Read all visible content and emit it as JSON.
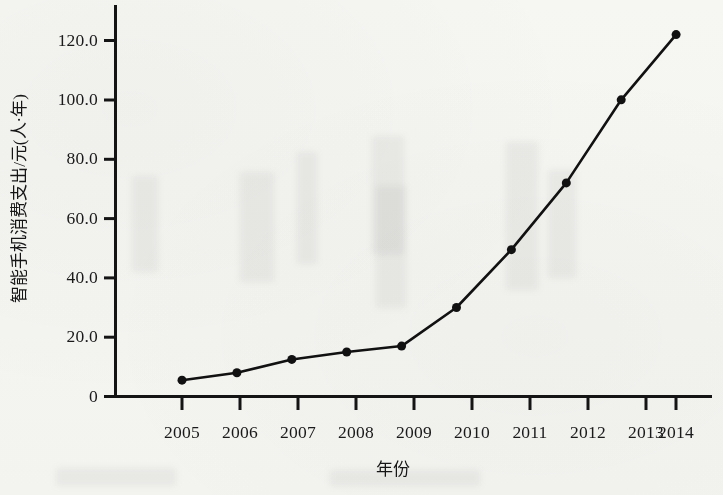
{
  "chart_data": {
    "type": "line",
    "title": "",
    "subtitle": "",
    "xlabel": "年份",
    "ylabel": "智能手机消费支出/元(人·年)",
    "x": [
      2005,
      2006,
      2007,
      2008,
      2009,
      2010,
      2011,
      2012,
      2013,
      2014
    ],
    "categories": [
      "2005",
      "2006",
      "2007",
      "2008",
      "2009",
      "2010",
      "2011",
      "2012",
      "2013",
      "2014"
    ],
    "values": [
      5.5,
      8.0,
      12.5,
      15.0,
      17.0,
      30.0,
      49.5,
      72.0,
      100.0,
      122.0
    ],
    "series": [
      {
        "name": "智能手机消费支出",
        "values": [
          5.5,
          8.0,
          12.5,
          15.0,
          17.0,
          30.0,
          49.5,
          72.0,
          100.0,
          122.0
        ],
        "color": "#111111",
        "marker": "filled-circle",
        "line_width": 2.6,
        "marker_size": 9
      }
    ],
    "ylim": [
      0,
      128
    ],
    "xlim": [
      2004.4,
      2014.9
    ],
    "yticks": [
      0,
      20,
      40,
      60,
      80,
      100,
      120
    ],
    "ytick_labels": [
      "0",
      "20.0",
      "40.0",
      "60.0",
      "80.0",
      "100.0",
      "120.0"
    ],
    "xticks": [
      2005,
      2006,
      2007,
      2008,
      2009,
      2010,
      2011,
      2012,
      2013,
      2014
    ],
    "xtick_labels": [
      "2005",
      "2006",
      "2007",
      "2008",
      "2009",
      "2010",
      "2011",
      "2012",
      "2013",
      "2014"
    ],
    "grid": false,
    "legend": false,
    "legend_position": "none",
    "axis_color": "#141414",
    "background_color": "#fbfbfa",
    "spines": [
      "left",
      "bottom"
    ],
    "annotations": []
  },
  "axes": {
    "y_title": "智能手机消费支出/元(人·年)",
    "x_title": "年份"
  }
}
